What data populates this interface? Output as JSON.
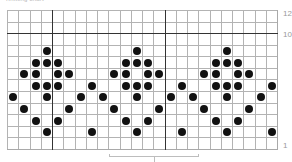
{
  "caption": "Knitting chart",
  "chart": {
    "columns": 24,
    "rows": 12,
    "cell_width_px": 11.3,
    "cell_height_px": 11.67,
    "colors": {
      "dot": "#111111",
      "grid": "#b3b3b3",
      "bold_line": "#333333",
      "label": "#9a9a9a"
    },
    "bold_vertical_after_columns": [
      4,
      14
    ],
    "bold_horizontal_between_rows": [
      10,
      11
    ],
    "row_labels": [
      {
        "row": 12,
        "text": "12"
      },
      {
        "row": 10,
        "text": "10"
      },
      {
        "row": 1,
        "text": "1"
      }
    ],
    "repeat_bracket": {
      "start_col": 9,
      "end_col": 17,
      "label": "8-stitch repeat"
    },
    "dots": [
      {
        "row": 9,
        "cols": [
          3,
          11,
          19
        ]
      },
      {
        "row": 8,
        "cols": [
          2,
          3,
          4,
          10,
          11,
          12,
          18,
          19,
          20
        ]
      },
      {
        "row": 7,
        "cols": [
          1,
          2,
          4,
          5,
          9,
          10,
          12,
          13,
          17,
          18,
          20,
          21
        ]
      },
      {
        "row": 6,
        "cols": [
          2,
          3,
          4,
          7,
          10,
          11,
          12,
          15,
          18,
          19,
          20,
          23
        ]
      },
      {
        "row": 5,
        "cols": [
          0,
          3,
          6,
          8,
          11,
          14,
          16,
          19,
          22
        ]
      },
      {
        "row": 4,
        "cols": [
          1,
          5,
          9,
          13,
          17,
          21
        ]
      },
      {
        "row": 3,
        "cols": [
          2,
          4,
          10,
          12,
          18,
          20
        ]
      },
      {
        "row": 2,
        "cols": [
          3,
          7,
          11,
          15,
          19,
          23
        ]
      }
    ],
    "legend": {
      "dot": "filled-circle-stitch-icon"
    }
  }
}
